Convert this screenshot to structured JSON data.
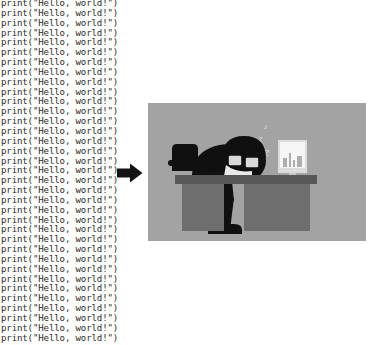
{
  "page": {
    "background_color": "#ffffff",
    "width": 373,
    "height": 345
  },
  "code_listing": {
    "name": "repeated-print-statements",
    "language": "python",
    "line_text": "print(\"Hello, world!\")",
    "line_count": 35,
    "text_color": "#2b2b2b",
    "font": "monospace",
    "note_last_line_clipped": true
  },
  "arrow": {
    "name": "right-arrow",
    "direction": "right",
    "color": "#141414",
    "label": ""
  },
  "illustration": {
    "name": "person-asleep-at-desk",
    "caption": "",
    "background_color": "#a3a3a3",
    "desk_color": "#6e6e6e",
    "desk_top_color": "#585858",
    "figure_color": "#101010",
    "monitor_screen_color": "#f2f2f2",
    "monitor_frame_color": "#d8d8d8",
    "sleep_symbol": "z",
    "sleep_symbol_count": 3,
    "elements": [
      "office-chair",
      "desk",
      "sleeping-person",
      "eyeglasses",
      "computer-monitor",
      "sleep-z-symbols"
    ]
  }
}
